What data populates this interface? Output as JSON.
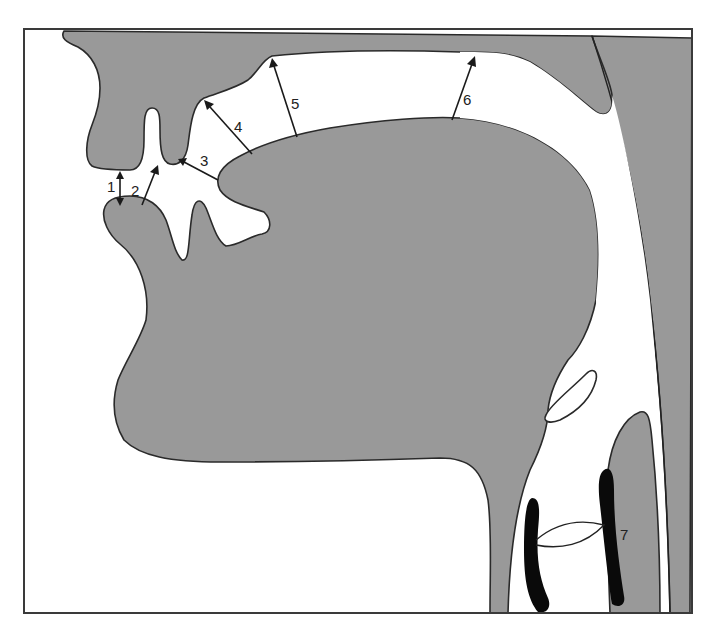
{
  "figure": {
    "colors": {
      "tissue": "#999999",
      "air": "#ffffff",
      "outline": "#2a2a2a",
      "vocal_folds": "#0a0a0a",
      "frame": "#3a3a3a"
    }
  },
  "labels": [
    {
      "id": "1",
      "text": "1",
      "x": 107,
      "y": 192
    },
    {
      "id": "2",
      "text": "2",
      "x": 133,
      "y": 196
    },
    {
      "id": "3",
      "text": "3",
      "x": 200,
      "y": 166
    },
    {
      "id": "4",
      "text": "4",
      "x": 234,
      "y": 132
    },
    {
      "id": "5",
      "text": "5",
      "x": 291,
      "y": 109
    },
    {
      "id": "6",
      "text": "6",
      "x": 464,
      "y": 105
    },
    {
      "id": "7",
      "text": "7",
      "x": 620,
      "y": 540
    }
  ],
  "regions": [
    "upper-lip",
    "upper-teeth",
    "alveolar-ridge",
    "hard-palate",
    "soft-palate",
    "uvula",
    "pharyngeal-wall",
    "lower-lip",
    "lower-teeth",
    "tongue",
    "epiglottis",
    "larynx",
    "vocal-folds"
  ]
}
